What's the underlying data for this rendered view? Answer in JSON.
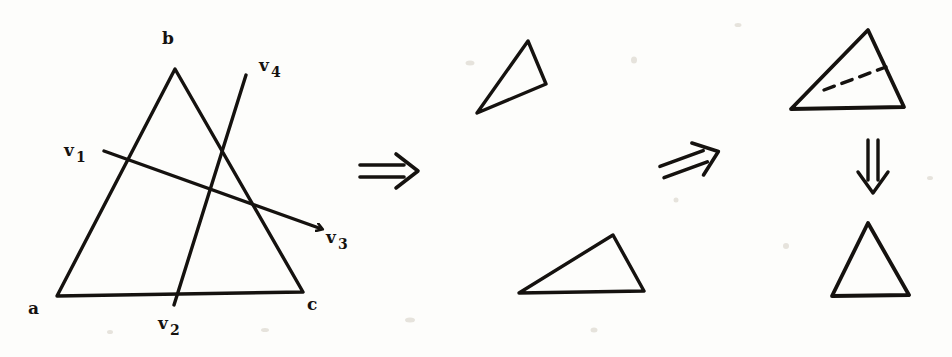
{
  "figure": {
    "background_color": "#fdfdfb",
    "ink_color": "#15120f",
    "stroke_width": 3.2
  },
  "labels": {
    "vertex_a": "a",
    "vertex_b": "b",
    "vertex_c": "c",
    "v1_base": "v",
    "v1_sub": "1",
    "v2_base": "v",
    "v2_sub": "2",
    "v3_base": "v",
    "v3_sub": "3",
    "v4_base": "v",
    "v4_sub": "4"
  },
  "label_positions": {
    "vertex_a": {
      "x": 28,
      "y": 300
    },
    "vertex_b": {
      "x": 162,
      "y": 30
    },
    "vertex_c": {
      "x": 307,
      "y": 296
    },
    "v1": {
      "x": 64,
      "y": 142
    },
    "v2": {
      "x": 158,
      "y": 315
    },
    "v3": {
      "x": 326,
      "y": 229
    },
    "v4": {
      "x": 259,
      "y": 57
    }
  },
  "shapes": {
    "main_triangle": {
      "name": "triangle-abc",
      "points": [
        {
          "id": "a",
          "x": 57,
          "y": 296
        },
        {
          "id": "b",
          "x": 175,
          "y": 69
        },
        {
          "id": "c",
          "x": 303,
          "y": 292
        }
      ]
    },
    "cut_line_v1_v3": {
      "name": "cut-line-v1-v3",
      "from": {
        "x": 104,
        "y": 151
      },
      "to": {
        "x": 319,
        "y": 228
      },
      "arrowhead": "end"
    },
    "cut_line_v2_v4": {
      "name": "cut-line-v2-v4",
      "from": {
        "x": 174,
        "y": 305
      },
      "to": {
        "x": 246,
        "y": 75
      },
      "arrowhead": "none"
    },
    "piece_top": {
      "name": "piece-triangle-upper",
      "points": [
        {
          "x": 528,
          "y": 41
        },
        {
          "x": 546,
          "y": 84
        },
        {
          "x": 477,
          "y": 113
        }
      ]
    },
    "piece_bottom": {
      "name": "piece-triangle-lower",
      "points": [
        {
          "x": 519,
          "y": 293
        },
        {
          "x": 613,
          "y": 235
        },
        {
          "x": 644,
          "y": 291
        }
      ]
    },
    "merged_triangle": {
      "name": "merged-triangle-with-seam",
      "points": [
        {
          "x": 868,
          "y": 30
        },
        {
          "x": 904,
          "y": 107
        },
        {
          "x": 791,
          "y": 109
        }
      ],
      "seam": {
        "name": "seam-dashed-line",
        "from": {
          "x": 824,
          "y": 90
        },
        "to": {
          "x": 886,
          "y": 67
        },
        "style": "dashed"
      }
    },
    "result_triangle": {
      "name": "result-triangle",
      "points": [
        {
          "x": 868,
          "y": 223
        },
        {
          "x": 909,
          "y": 295
        },
        {
          "x": 832,
          "y": 296
        }
      ]
    }
  },
  "arrows": [
    {
      "name": "implies-arrow-1",
      "glyph": "double-arrow-right",
      "from": {
        "x": 360,
        "y": 171
      },
      "to": {
        "x": 424,
        "y": 171
      },
      "angle_deg": 0
    },
    {
      "name": "implies-arrow-2",
      "glyph": "double-arrow-right",
      "from": {
        "x": 662,
        "y": 172
      },
      "to": {
        "x": 728,
        "y": 148
      },
      "angle_deg": -20
    },
    {
      "name": "implies-arrow-3",
      "glyph": "double-arrow-down",
      "from": {
        "x": 873,
        "y": 140
      },
      "to": {
        "x": 873,
        "y": 199
      },
      "angle_deg": 90
    }
  ],
  "speckles": [
    {
      "x": 470,
      "y": 63,
      "w": 9,
      "h": 5
    },
    {
      "x": 634,
      "y": 60,
      "w": 6,
      "h": 7
    },
    {
      "x": 738,
      "y": 25,
      "w": 7,
      "h": 4
    },
    {
      "x": 110,
      "y": 332,
      "w": 6,
      "h": 4
    },
    {
      "x": 265,
      "y": 330,
      "w": 8,
      "h": 4
    },
    {
      "x": 410,
      "y": 320,
      "w": 10,
      "h": 5
    },
    {
      "x": 594,
      "y": 330,
      "w": 7,
      "h": 5
    },
    {
      "x": 786,
      "y": 246,
      "w": 6,
      "h": 6
    },
    {
      "x": 676,
      "y": 200,
      "w": 5,
      "h": 5
    },
    {
      "x": 930,
      "y": 178,
      "w": 6,
      "h": 4
    }
  ]
}
